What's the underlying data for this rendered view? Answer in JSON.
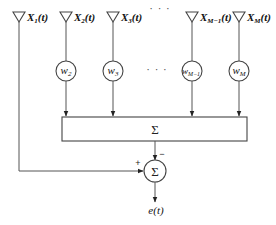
{
  "diagram": {
    "type": "adaptive-sidelobe-canceller-block-diagram",
    "inputs": [
      {
        "id": "X1",
        "symbol": "X",
        "sub": "1",
        "arg": "(t)",
        "weighted": false
      },
      {
        "id": "X2",
        "symbol": "X",
        "sub": "2",
        "arg": "(t)",
        "weighted": true,
        "weight": {
          "symbol": "w",
          "sub": "2"
        }
      },
      {
        "id": "X3",
        "symbol": "X",
        "sub": "3",
        "arg": "(t)",
        "weighted": true,
        "weight": {
          "symbol": "w",
          "sub": "3"
        }
      },
      {
        "id": "XM-1",
        "symbol": "X",
        "sub": "M−1",
        "arg": "(t)",
        "weighted": true,
        "weight": {
          "symbol": "w",
          "sub": "M−1"
        }
      },
      {
        "id": "XM",
        "symbol": "X",
        "sub": "M",
        "arg": "(t)",
        "weighted": true,
        "weight": {
          "symbol": "w",
          "sub": "M"
        }
      }
    ],
    "ellipsis_top": "· · ·",
    "ellipsis_mid": "· · ·",
    "summer_box_label": "Σ",
    "summer_circle_label": "Σ",
    "sign_plus": "+",
    "sign_minus": "−",
    "output_label": "e(t)"
  }
}
